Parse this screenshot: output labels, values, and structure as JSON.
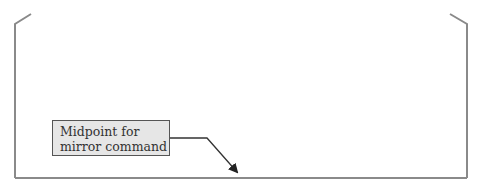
{
  "diagram": {
    "callout": {
      "lines": [
        "Midpoint for",
        "mirror command"
      ]
    },
    "colors": {
      "outline": "#8a8a8a",
      "callout_fill": "#e6e6e6",
      "callout_border": "#555555",
      "leader": "#333333"
    }
  }
}
